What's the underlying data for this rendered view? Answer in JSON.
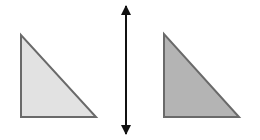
{
  "diagram": {
    "left_triangle": {
      "points": "21,35 21,117 96,117",
      "fill": "#e2e2e2",
      "stroke": "#6a6a6a"
    },
    "right_triangle": {
      "points": "164,34 164,117 239,117",
      "fill": "#b4b4b4",
      "stroke": "#6a6a6a"
    },
    "mirror_arrow": {
      "x": 126,
      "y1": 2,
      "y2": 138,
      "color": "#111111",
      "heads": "both"
    }
  }
}
